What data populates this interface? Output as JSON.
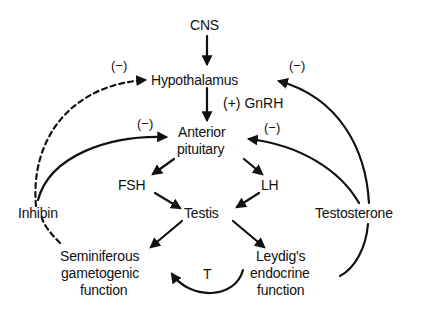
{
  "diagram": {
    "nodes": {
      "cns": "CNS",
      "hypothalamus": "Hypothalamus",
      "anterior_pituitary_1": "Anterior",
      "anterior_pituitary_2": "pituitary",
      "fsh": "FSH",
      "lh": "LH",
      "testis": "Testis",
      "inhibin": "Inhibin",
      "testosterone": "Testosterone",
      "seminiferous_1": "Seminiferous",
      "seminiferous_2": "gametogenic",
      "seminiferous_3": "function",
      "leydig_1": "Leydig's",
      "leydig_2": "endocrine",
      "leydig_3": "function",
      "t": "T"
    },
    "edge_labels": {
      "gnrh": "(+) GnRH",
      "inhibin_to_hypothalamus": "(−)",
      "inhibin_to_pituitary": "(−)",
      "testosterone_to_hypothalamus": "(−)",
      "testosterone_to_pituitary": "(−)"
    },
    "edges": [
      {
        "from": "CNS",
        "to": "Hypothalamus",
        "style": "solid"
      },
      {
        "from": "Hypothalamus",
        "to": "Anterior pituitary",
        "style": "solid",
        "label": "(+) GnRH"
      },
      {
        "from": "Anterior pituitary",
        "to": "FSH",
        "style": "solid"
      },
      {
        "from": "Anterior pituitary",
        "to": "LH",
        "style": "solid"
      },
      {
        "from": "FSH",
        "to": "Testis",
        "style": "solid"
      },
      {
        "from": "LH",
        "to": "Testis",
        "style": "solid"
      },
      {
        "from": "Testis",
        "to": "Seminiferous gametogenic function",
        "style": "solid"
      },
      {
        "from": "Testis",
        "to": "Leydig's endocrine function",
        "style": "solid"
      },
      {
        "from": "Leydig's endocrine function",
        "to": "Seminiferous gametogenic function",
        "style": "solid",
        "label": "T"
      },
      {
        "from": "Seminiferous gametogenic function",
        "to": "Inhibin",
        "style": "dashed"
      },
      {
        "from": "Inhibin",
        "to": "Hypothalamus",
        "style": "dashed",
        "label": "(−)"
      },
      {
        "from": "Inhibin",
        "to": "Anterior pituitary",
        "style": "solid",
        "label": "(−)"
      },
      {
        "from": "Leydig's endocrine function",
        "to": "Testosterone",
        "style": "solid"
      },
      {
        "from": "Testosterone",
        "to": "Hypothalamus",
        "style": "solid",
        "label": "(−)"
      },
      {
        "from": "Testosterone",
        "to": "Anterior pituitary",
        "style": "solid",
        "label": "(−)"
      }
    ],
    "colors": {
      "ink": "#111111",
      "background": "#ffffff"
    }
  }
}
